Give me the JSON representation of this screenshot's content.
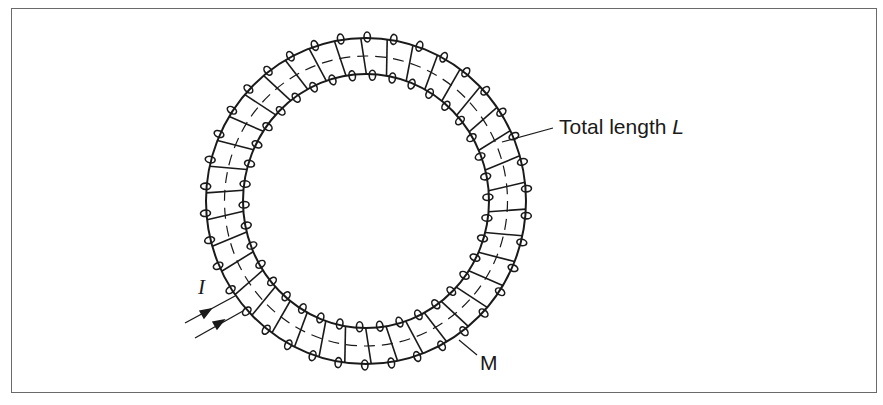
{
  "figure": {
    "type": "toroidal coil (toroid / Rowland ring) with uniform winding",
    "labels": {
      "total_length": "Total length ",
      "total_length_var": "L",
      "core_material": "M",
      "current": "I"
    },
    "components": [
      {
        "id": "ring-core",
        "description": "Annular core of magnetic material M"
      },
      {
        "id": "winding",
        "description": "Uniform helical winding of turns around the ring"
      },
      {
        "id": "mean-path",
        "description": "Dashed mean circumference of total length L"
      },
      {
        "id": "current-leads",
        "description": "Two lead wires with arrows indicating current I entering/leaving"
      }
    ],
    "geometry": {
      "center": [
        366,
        201
      ],
      "outer_radius": [
        160,
        163
      ],
      "inner_radius": [
        123,
        127
      ],
      "mean_radius": [
        141.5,
        145
      ],
      "turn_count_visible": 38
    },
    "colors": {
      "stroke": "#1a1a1a",
      "frame": "#6a6a6a",
      "background": "#ffffff"
    }
  }
}
